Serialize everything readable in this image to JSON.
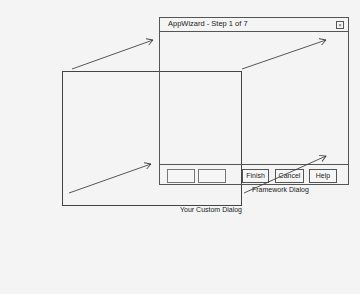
{
  "framework_dialog": {
    "title": "AppWizard - Step 1 of 7",
    "close_icon": "close-box-icon",
    "buttons": [
      {
        "label": ""
      },
      {
        "label": ""
      },
      {
        "label": "Finish"
      },
      {
        "label": "Cancel"
      },
      {
        "label": "Help"
      }
    ],
    "caption": "Framework Dialog"
  },
  "custom_dialog": {
    "caption": "Your Custom Dialog"
  },
  "arrows": [
    {
      "from": [
        72,
        69
      ],
      "to": [
        153,
        40
      ]
    },
    {
      "from": [
        242,
        69
      ],
      "to": [
        326,
        40
      ]
    },
    {
      "from": [
        69,
        193
      ],
      "to": [
        151,
        164
      ]
    },
    {
      "from": [
        244,
        193
      ],
      "to": [
        326,
        156
      ]
    }
  ],
  "colors": {
    "background": "#f4f4f4",
    "line": "#555555"
  }
}
